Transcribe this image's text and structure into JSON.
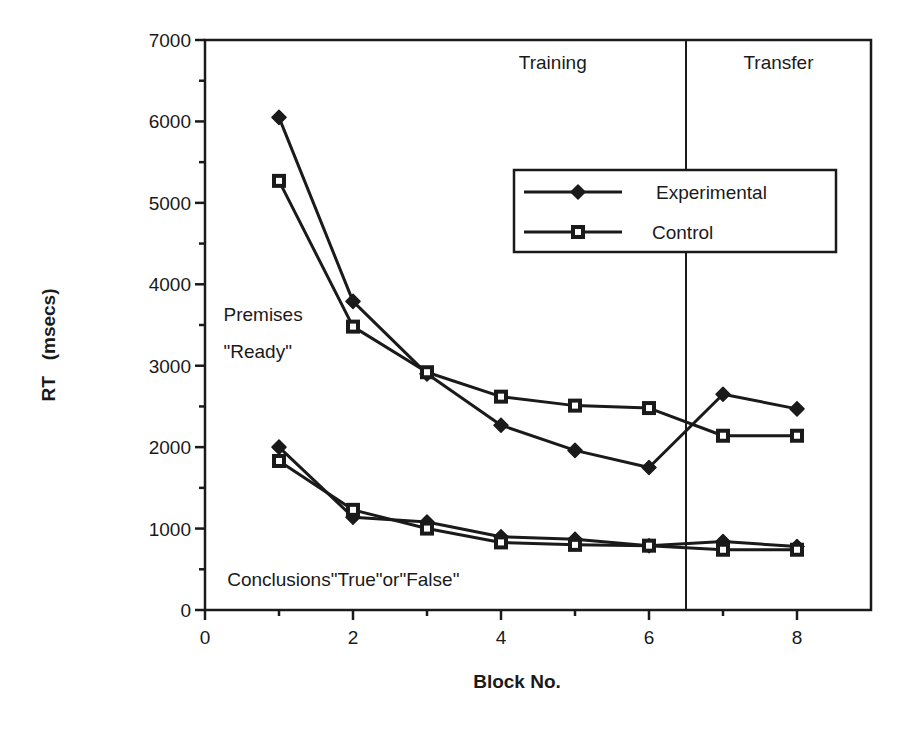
{
  "chart_data": {
    "type": "line",
    "title": "",
    "xlabel": "Block No.",
    "ylabel": "RT   (msecs)",
    "xlim": [
      0,
      9
    ],
    "ylim": [
      0,
      7000
    ],
    "x_ticks": [
      0,
      2,
      4,
      6,
      8
    ],
    "x_tick_labels": [
      "0",
      "2",
      "4",
      "6",
      "8"
    ],
    "x_minor_ticks": [
      1,
      3,
      5,
      7
    ],
    "y_ticks": [
      0,
      1000,
      2000,
      3000,
      4000,
      5000,
      6000,
      7000
    ],
    "y_tick_labels": [
      "0",
      "1000",
      "2000",
      "3000",
      "4000",
      "5000",
      "6000",
      "7000"
    ],
    "y_minor_ticks": [
      500,
      1500,
      2500,
      3500,
      4500,
      5500,
      6500
    ],
    "grid": false,
    "legend_position": "upper right (inside plot)",
    "divider_x": 6.5,
    "region_labels": [
      {
        "text": "Training",
        "x": 4.7,
        "y": 6650
      },
      {
        "text": "Transfer",
        "x": 7.75,
        "y": 6650
      }
    ],
    "annotations": [
      {
        "text": "Premises",
        "x": 0.25,
        "y": 3550
      },
      {
        "text": "\"Ready\"",
        "x": 0.25,
        "y": 3100
      },
      {
        "text": "Conclusions\"True\"or\"False\"",
        "x": 0.3,
        "y": 300
      }
    ],
    "x": [
      1,
      2,
      3,
      4,
      5,
      6,
      7,
      8
    ],
    "series": [
      {
        "name": "Experimental",
        "group": "Premises \"Ready\"",
        "marker": "filled-diamond",
        "values": [
          6050,
          3790,
          2900,
          2270,
          1960,
          1750,
          2650,
          2470
        ]
      },
      {
        "name": "Control",
        "group": "Premises \"Ready\"",
        "marker": "open-square",
        "values": [
          5270,
          3480,
          2920,
          2620,
          2510,
          2480,
          2140,
          2140
        ]
      },
      {
        "name": "Experimental",
        "group": "Conclusions \"True\" or \"False\"",
        "marker": "filled-diamond",
        "values": [
          2000,
          1140,
          1080,
          900,
          870,
          790,
          840,
          780
        ]
      },
      {
        "name": "Control",
        "group": "Conclusions \"True\" or \"False\"",
        "marker": "open-square",
        "values": [
          1830,
          1230,
          1000,
          830,
          800,
          790,
          740,
          740
        ]
      }
    ],
    "legend": [
      {
        "label": "Experimental",
        "marker": "filled-diamond"
      },
      {
        "label": "Control",
        "marker": "open-square"
      }
    ]
  },
  "colors": {
    "ink": "#1a1a1a",
    "background": "#ffffff"
  }
}
